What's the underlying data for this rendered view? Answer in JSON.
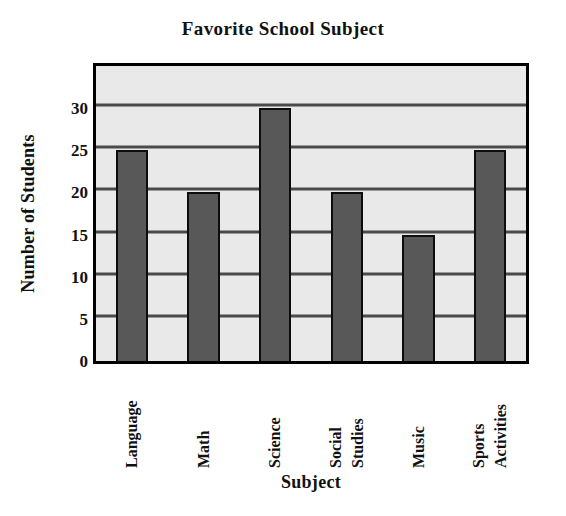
{
  "chart_data": {
    "type": "bar",
    "title": "Favorite School Subject",
    "xlabel": "Subject",
    "ylabel": "Number of Students",
    "categories": [
      "Language",
      "Math",
      "Science",
      "Social Studies",
      "Music",
      "Sports Activities"
    ],
    "category_lines": [
      [
        "Language"
      ],
      [
        "Math"
      ],
      [
        "Science"
      ],
      [
        "Social",
        "Studies"
      ],
      [
        "Music"
      ],
      [
        "Sports",
        "Activities"
      ]
    ],
    "values": [
      25,
      20,
      30,
      20,
      15,
      25
    ],
    "ylim": [
      0,
      35
    ],
    "yticks": [
      0,
      5,
      10,
      15,
      20,
      25,
      30
    ],
    "ytick_labels": [
      "0",
      "5",
      "10",
      "15",
      "20",
      "25",
      "30"
    ],
    "grid": true,
    "legend": false,
    "bar_color": "#585858",
    "bar_edge_color": "#0d0d0d",
    "plot_background": "#e9e9e9",
    "gridline_color": "#4a4a4a",
    "frame_color": "#000000",
    "text_color": "#111111"
  }
}
